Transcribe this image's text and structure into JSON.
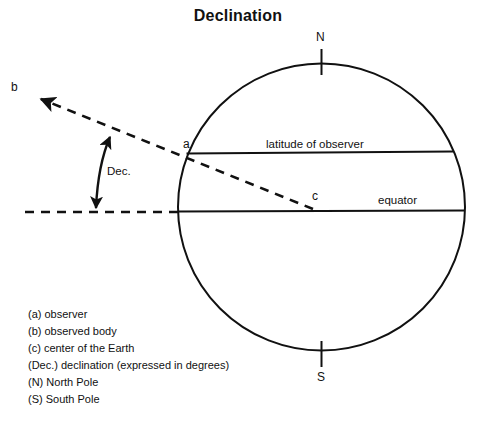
{
  "title": "Declination",
  "diagram": {
    "poles": {
      "north_label": "N",
      "south_label": "S"
    },
    "points": {
      "observer_label": "a",
      "body_label": "b",
      "center_label": "c"
    },
    "lines": {
      "latitude_label": "latitude of observer",
      "equator_label": "equator"
    },
    "angle": {
      "declination_label": "Dec."
    },
    "colors": {
      "stroke": "#111111",
      "background": "#ffffff"
    }
  },
  "legend": {
    "items": [
      "(a) observer",
      "(b) observed body",
      "(c) center of the Earth",
      "(Dec.) declination (expressed in degrees)",
      "(N) North Pole",
      "(S) South Pole"
    ]
  }
}
